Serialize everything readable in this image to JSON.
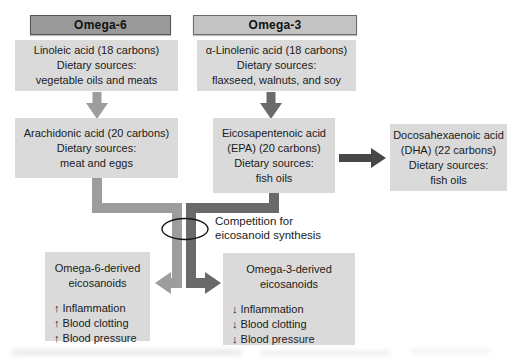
{
  "diagram": {
    "headers": {
      "omega6": "Omega-6",
      "omega3": "Omega-3"
    },
    "boxes": {
      "linoleic": {
        "lines": [
          "Linoleic acid (18 carbons)",
          "Dietary sources:",
          "vegetable oils and meats"
        ]
      },
      "alpha_linolenic": {
        "lines": [
          "α-Linolenic acid (18 carbons)",
          "Dietary sources:",
          "flaxseed, walnuts, and soy"
        ]
      },
      "arachidonic": {
        "lines": [
          "Arachidonic acid (20 carbons)",
          "Dietary sources:",
          "meat and eggs"
        ]
      },
      "epa": {
        "lines": [
          "Eicosapentenoic acid",
          "(EPA) (20 carbons)",
          "Dietary sources:",
          "fish oils"
        ]
      },
      "dha": {
        "lines": [
          "Docosahexaenoic acid",
          "(DHA) (22 carbons)",
          "Dietary sources:",
          "fish oils"
        ]
      },
      "omega6_derived": {
        "title_lines": [
          "Omega-6-derived",
          "eicosanoids"
        ],
        "effects": [
          "↑ Inflammation",
          "↑ Blood clotting",
          "↑ Blood pressure"
        ]
      },
      "omega3_derived": {
        "title_lines": [
          "Omega-3-derived",
          "eicosanoids"
        ],
        "effects": [
          "↓ Inflammation",
          "↓ Blood clotting",
          "↓ Blood pressure"
        ]
      }
    },
    "annotation": {
      "lines": [
        "Competition for",
        "eicosanoid synthesis"
      ]
    },
    "colors": {
      "box_fill": "#dadada",
      "header_omega6_fill": "#9a9a9a",
      "header_omega3_fill": "#c3c3c3",
      "arrow_light": "#9d9d9d",
      "arrow_dark": "#6a6a6a",
      "arrow_darkest": "#474747",
      "text": "#1b1b1b",
      "ellipse_stroke": "#151515"
    }
  }
}
